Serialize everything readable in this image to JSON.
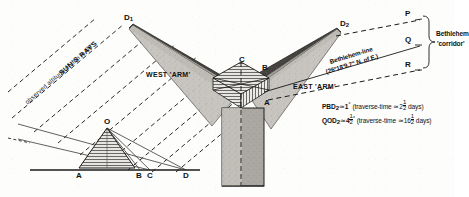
{
  "figure": {
    "title_hidden": "",
    "left_diagram": {
      "name": "sun-altitude-section",
      "sun_rays_label": "SUN'S RAYS",
      "altitude_label": "observed altitude of sun ≃ 60°",
      "apex_label": "O",
      "baseline_points": [
        "A",
        "B",
        "C",
        "D"
      ]
    },
    "right_diagram": {
      "name": "bethlehem-angle-plan",
      "west_arm_label": "WEST 'ARM'",
      "east_arm_label": "EAST 'ARM'",
      "tip_west_label": "D",
      "tip_west_sub": "1",
      "tip_east_label": "D",
      "tip_east_sub": "2",
      "vertex_labels": [
        "C",
        "B",
        "A"
      ],
      "bethlehem_line_label": "Bethlehem-line",
      "bethlehem_line_angle": "(26°18'9.7\"  N. of E.)",
      "corridor_points": [
        "P",
        "Q",
        "R"
      ],
      "corridor_label_line1": "Bethlehem",
      "corridor_label_line2": "'corridor'",
      "notes": [
        {
          "symbol": "PBD",
          "symbol_sub": "2",
          "approx": "≃",
          "value": "1",
          "unit": "°",
          "paren_open": "(traverse-time",
          "paren_approx": "≃",
          "whole": "2",
          "num": "1",
          "den": "2",
          "paren_close": "days)"
        },
        {
          "symbol": "QOD",
          "symbol_sub": "2",
          "approx": "≃",
          "value": "4",
          "frac_num": "1",
          "frac_den": "2",
          "unit": "°",
          "paren_open": "(traverse-time",
          "paren_approx": "≃",
          "whole": "16",
          "num": "1",
          "den": "2",
          "paren_close": "days)"
        }
      ]
    },
    "colors": {
      "ink": "#1a1a1a",
      "paper": "#fdfdfc",
      "shade_light": "#c9c6c1",
      "shade_mid": "#9b9893",
      "shade_dark": "#3a3936"
    }
  }
}
